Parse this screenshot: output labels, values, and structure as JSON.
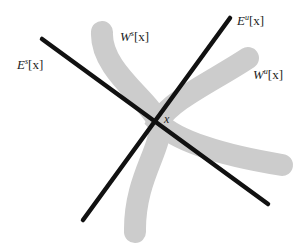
{
  "diagram": {
    "colors": {
      "background": "#ffffff",
      "manifold_band": "#cccccc",
      "eigenline": "#111111",
      "text": "#222222"
    },
    "labels": {
      "es": {
        "base": "E",
        "sup": "s",
        "arg": "[x]"
      },
      "ws": {
        "base": "W",
        "sup": "s",
        "arg": "[x]"
      },
      "eu": {
        "base": "E",
        "sup": "u",
        "arg": "[x]"
      },
      "wu": {
        "base": "W",
        "sup": "u",
        "arg": "[x]"
      },
      "point": "x"
    },
    "lines": [
      {
        "name": "stable-eigenspace-line",
        "x1": 42,
        "y1": 39,
        "x2": 268,
        "y2": 204
      },
      {
        "name": "unstable-eigenspace-line",
        "x1": 230,
        "y1": 18,
        "x2": 83,
        "y2": 220
      }
    ],
    "point": {
      "x": 158,
      "y": 122
    }
  }
}
